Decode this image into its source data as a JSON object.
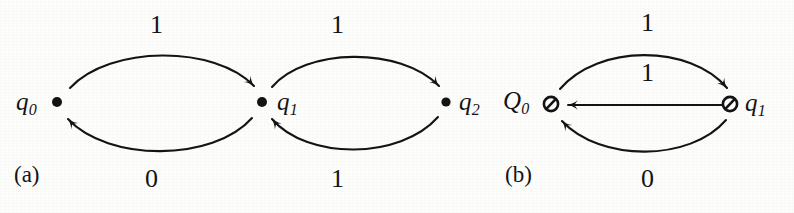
{
  "figure": {
    "background_color": "#fdfdfc",
    "ink_color": "#141414",
    "panels": [
      {
        "id": "a",
        "caption": "(a)",
        "node_style": "filled-dot",
        "states": [
          {
            "id": "q0",
            "base": "q",
            "subscript": "0",
            "label": "q0",
            "x": 57,
            "y": 102,
            "label_side": "left"
          },
          {
            "id": "q1",
            "base": "q",
            "subscript": "1",
            "label": "q1",
            "x": 262,
            "y": 102,
            "label_side": "right"
          },
          {
            "id": "q2",
            "base": "q",
            "subscript": "2",
            "label": "q2",
            "x": 446,
            "y": 102,
            "label_side": "right"
          }
        ],
        "transitions": [
          {
            "from": "q0",
            "to": "q1",
            "symbol": "1",
            "shape": "arc-above",
            "label_x": 157,
            "label_y": 18
          },
          {
            "from": "q1",
            "to": "q0",
            "symbol": "0",
            "shape": "arc-below",
            "label_x": 152,
            "label_y": 172
          },
          {
            "from": "q1",
            "to": "q2",
            "symbol": "1",
            "shape": "arc-above",
            "label_x": 337,
            "label_y": 18
          },
          {
            "from": "q2",
            "to": "q1",
            "symbol": "1",
            "shape": "arc-below",
            "label_x": 337,
            "label_y": 172
          }
        ],
        "caption_x": 14,
        "caption_y": 166
      },
      {
        "id": "b",
        "caption": "(b)",
        "node_style": "slashed-circle",
        "states": [
          {
            "id": "Q0",
            "base": "Q",
            "subscript": "0",
            "label": "Q0",
            "x": 551,
            "y": 104,
            "label_side": "left"
          },
          {
            "id": "q1",
            "base": "q",
            "subscript": "1",
            "label": "q1",
            "x": 730,
            "y": 104,
            "label_side": "right"
          }
        ],
        "transitions": [
          {
            "from": "Q0",
            "to": "q1",
            "symbol": "1",
            "shape": "arc-above",
            "label_x": 648,
            "label_y": 16
          },
          {
            "from": "q1",
            "to": "Q0",
            "symbol": "1",
            "shape": "straight",
            "label_x": 648,
            "label_y": 64
          },
          {
            "from": "q1",
            "to": "Q0",
            "symbol": "0",
            "shape": "arc-below",
            "label_x": 648,
            "label_y": 172
          }
        ],
        "caption_x": 505,
        "caption_y": 166
      }
    ]
  }
}
